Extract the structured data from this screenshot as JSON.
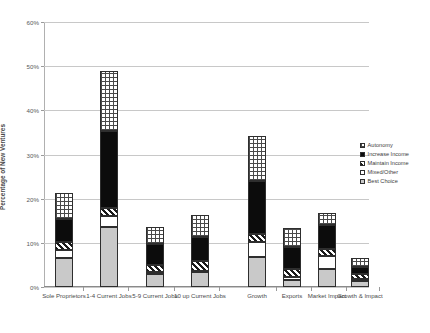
{
  "chart_data": {
    "type": "bar",
    "title": "",
    "xlabel": "",
    "ylabel": "Percentage of New Ventures",
    "ylim": [
      0,
      60
    ],
    "ytick_labels": [
      "0%",
      "10%",
      "20%",
      "30%",
      "40%",
      "50%",
      "60%"
    ],
    "ytick_values": [
      0,
      10,
      20,
      30,
      40,
      50,
      60
    ],
    "grid": true,
    "stacked": true,
    "legend_position": "right",
    "categories": [
      "Sole Proprietors",
      "1-4 Current Jobs",
      "5-9 Current Jobs",
      "10 up Current Jobs",
      "Growth",
      "Exports",
      "Market Impact",
      "Growth & Impact"
    ],
    "series": [
      {
        "name": "Best Choice",
        "pattern": "light-gray-solid",
        "values": [
          6.5,
          13.7,
          3.0,
          3.3,
          6.7,
          1.6,
          4.0,
          1.3
        ]
      },
      {
        "name": "Mixed/Other",
        "pattern": "white-solid",
        "values": [
          1.9,
          2.3,
          0.4,
          0.3,
          3.4,
          0.6,
          3.0,
          0.6
        ]
      },
      {
        "name": "Maintain Income",
        "pattern": "diagonal-hatch",
        "values": [
          1.8,
          1.9,
          1.5,
          2.3,
          1.9,
          1.8,
          1.5,
          1.1
        ]
      },
      {
        "name": "Increase Income",
        "pattern": "black-solid",
        "values": [
          5.3,
          17.4,
          4.8,
          5.4,
          12.0,
          5.0,
          5.5,
          1.5
        ]
      },
      {
        "name": "Autonomy",
        "pattern": "checkerboard",
        "values": [
          5.8,
          13.7,
          3.8,
          4.9,
          10.3,
          4.3,
          2.7,
          2.1
        ]
      }
    ],
    "totals": [
      21.3,
      49.0,
      13.5,
      16.2,
      34.3,
      13.3,
      16.7,
      6.6
    ]
  },
  "legend": {
    "items": [
      {
        "label": "Autonomy"
      },
      {
        "label": "Increase Income"
      },
      {
        "label": "Maintain Income"
      },
      {
        "label": "Mixed/Other"
      },
      {
        "label": "Best Choice"
      }
    ]
  }
}
